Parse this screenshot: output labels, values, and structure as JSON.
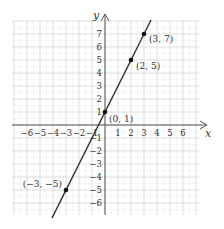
{
  "chart_data": {
    "type": "line",
    "title": "",
    "xlabel": "x",
    "ylabel": "y",
    "xlim": [
      -7,
      7
    ],
    "ylim": [
      -7,
      8
    ],
    "grid": true,
    "x_ticks": [
      "-6",
      "-5",
      "-4",
      "-3",
      "-2",
      "-1",
      "1",
      "2",
      "3",
      "4",
      "5",
      "6"
    ],
    "y_ticks": [
      "7",
      "6",
      "5",
      "4",
      "3",
      "2",
      "1",
      "-1",
      "-2",
      "-3",
      "-4",
      "-5",
      "-6"
    ],
    "series": [
      {
        "name": "y = 2x + 1",
        "x": [
          -4.08,
          3.54
        ],
        "y": [
          -7.16,
          8.08
        ]
      }
    ],
    "points": [
      {
        "x": 3,
        "y": 7,
        "label": "(3, 7)"
      },
      {
        "x": 2,
        "y": 5,
        "label": "(2, 5)"
      },
      {
        "x": 0,
        "y": 1,
        "label": "(0, 1)"
      },
      {
        "x": -3,
        "y": -5,
        "label": "(−3, −5)"
      }
    ],
    "annotations": [
      "(3, 7)",
      "(2, 5)",
      "(0, 1)",
      "(−3, −5)"
    ]
  },
  "colors": {
    "line": "#333333",
    "axis": "#555555",
    "grid_major": "#dddddd",
    "grid_minor": "#eeeeee"
  }
}
